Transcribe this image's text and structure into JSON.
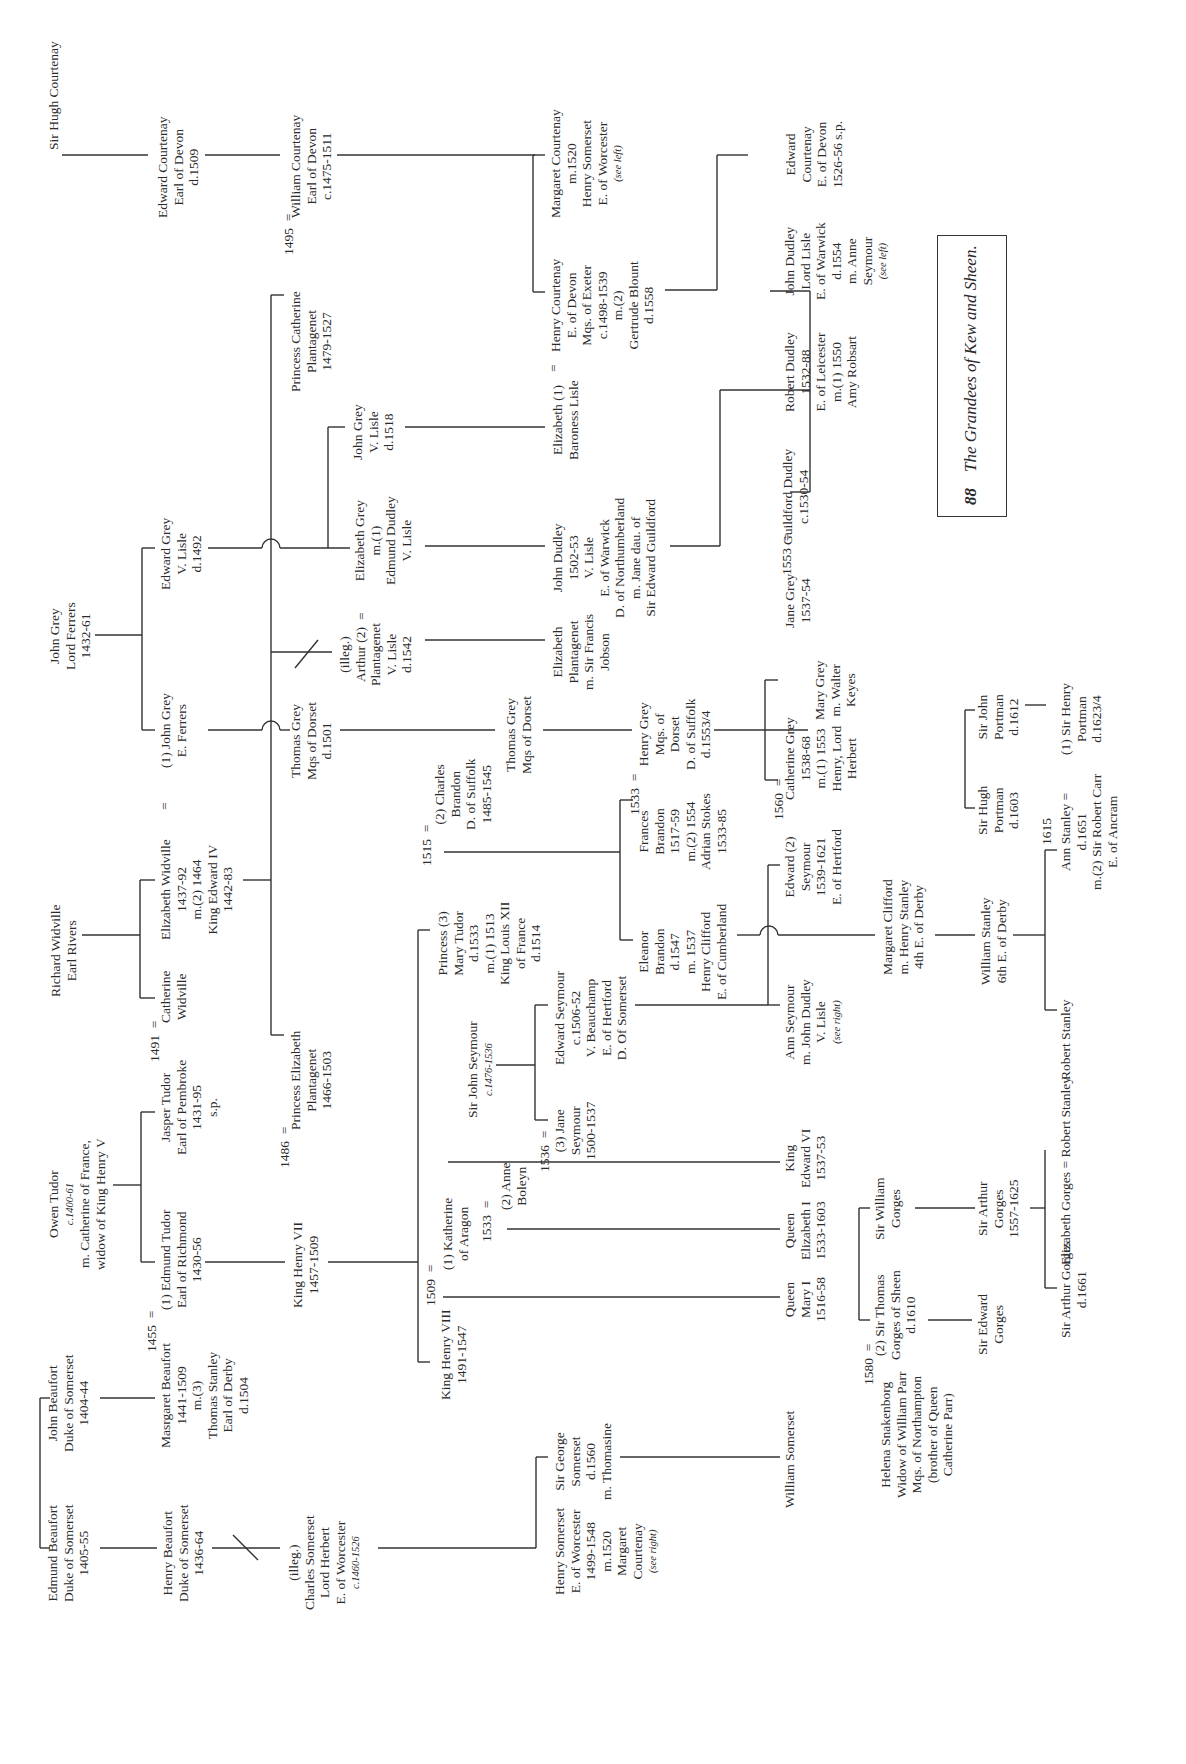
{
  "title": {
    "page_number": "88",
    "text": "The Grandees of Kew and Sheen."
  },
  "people": {
    "hugh_courtenay": [
      "Sir Hugh Courtenay"
    ],
    "edward_courtenay_d1509": [
      "Edward Courtenay",
      "Earl of Devon",
      "d.1509"
    ],
    "william_courtenay": [
      "William Courtenay",
      "Earl of Devon",
      "c.1475-1511"
    ],
    "margaret_courtenay": [
      "Margaret Courtenay",
      "m.1520",
      "Henry Somerset",
      "E. of Worcester",
      "(see left)"
    ],
    "henry_courtenay": [
      "Henry Courtenay",
      "E. of Devon",
      "Mqs. of Exeter",
      "c.1498-1539",
      "m.(2)",
      "Gertrude Blount",
      "d.1558"
    ],
    "edward_courtenay_1526": [
      "Edward",
      "Courtenay",
      "E. of Devon",
      "1526-56 s.p."
    ],
    "catherine_plantagenet": [
      "Princess Catherine",
      "Plantagenet",
      "1479-1527"
    ],
    "john_grey_ferrers": [
      "John Grey",
      "Lord Ferrers",
      "1432-61"
    ],
    "edward_grey": [
      "Edward Grey",
      "V. Lisle",
      "d.1492"
    ],
    "john_grey_e_ferrers": [
      "(1) John Grey",
      "E. Ferrers"
    ],
    "john_grey_lisle": [
      "John Grey",
      "V. Lisle",
      "d.1518"
    ],
    "elizabeth_grey": [
      "Elizabeth Grey",
      "m.(1)",
      "Edmund Dudley",
      "V. Lisle"
    ],
    "elizabeth_baroness_lisle": [
      "Elizabeth (1)",
      "Baroness Lisle"
    ],
    "john_dudley_northumberland": [
      "John Dudley",
      "1502-53",
      "V. Lisle",
      "E. of Warwick",
      "D. of Northumberland",
      "m. Jane dau. of",
      "Sir Edward Guildford"
    ],
    "guildford_dudley": [
      "Guildford Dudley",
      "c.1530-54"
    ],
    "robert_dudley": [
      "Robert Dudley",
      "1532-88",
      "E. of Leicester",
      "m.(1) 1550",
      "Amy Robsart"
    ],
    "john_dudley_warwick": [
      "John Dudley",
      "Lord Lisle",
      "E. of Warwick",
      "d.1554",
      "m. Anne",
      "Seymour",
      "(see left)"
    ],
    "thomas_grey_d1501": [
      "Thomas Grey",
      "Mqs of Dorset",
      "d.1501"
    ],
    "arthur_plantagenet": [
      "(illeg.)",
      "Arthur (2)",
      "Plantagenet",
      "V. Lisle",
      "d.1542"
    ],
    "elizabeth_plantagenet_jobson": [
      "Elizabeth",
      "Plantagenet",
      "m. Sir Francis",
      "Jobson"
    ],
    "thomas_grey_2": [
      "Thomas Grey",
      "Mqs of Dorset"
    ],
    "henry_grey": [
      "Henry Grey",
      "Mqs. of",
      "Dorset",
      "D. of Suffolk",
      "d.1553/4"
    ],
    "jane_grey": [
      "Jane Grey",
      "1537-54"
    ],
    "mary_grey": [
      "Mary Grey",
      "m. Walter",
      "Keyes"
    ],
    "catherine_grey": [
      "Catherine Grey",
      "1538-68",
      "m.(1) 1553",
      "Henry, Lord",
      "Herbert"
    ],
    "richard_widville": [
      "Richard Widville",
      "Earl Rivers"
    ],
    "elizabeth_widville": [
      "Elizabeth Widville",
      "1437-92",
      "m.(2) 1464",
      "King Edward IV",
      "1442-83"
    ],
    "catherine_widville": [
      "Catherine",
      "Widville"
    ],
    "charles_brandon": [
      "(2) Charles",
      "Brandon",
      "D. of Suffolk",
      "1485-1545"
    ],
    "mary_tudor": [
      "Princess (3)",
      "Mary Tudor",
      "d.1533",
      "m.(1) 1513",
      "King Louis XII",
      "of France",
      "d.1514"
    ],
    "frances_brandon": [
      "Frances",
      "Brandon",
      "1517-59",
      "m.(2) 1554",
      "Adrian Stokes",
      "1533-85"
    ],
    "eleanor_brandon": [
      "Eleanor",
      "Brandon",
      "d.1547",
      "m. 1537",
      "Henry Clifford",
      "E. of Cumberland"
    ],
    "edward_seymour_hertford": [
      "Edward (2)",
      "Seymour",
      "1539-1621",
      "E. of Hertford"
    ],
    "owen_tudor": [
      "Owen Tudor",
      "c.1400-61",
      "m. Catherine of France,",
      "widow of King Henry V"
    ],
    "jasper_tudor": [
      "Jasper Tudor",
      "Earl of Pembroke",
      "1431-95",
      "s.p."
    ],
    "edmund_tudor": [
      "(1) Edmund Tudor",
      "Earl of Richmond",
      "1430-56"
    ],
    "elizabeth_plantagenet": [
      "Princess Elizabeth",
      "Plantagenet",
      "1466-1503"
    ],
    "henry_vii": [
      "King Henry VII",
      "1457-1509"
    ],
    "john_seymour": [
      "Sir John Seymour",
      "c.1476-1536"
    ],
    "edward_seymour_somerset": [
      "Edward Seymour",
      "c.1506-52",
      "V. Beauchamp",
      "E. of Hertford",
      "D. Of Somerset"
    ],
    "jane_seymour": [
      "(3) Jane",
      "Seymour",
      "1500-1537"
    ],
    "anne_boleyn": [
      "(2) Anne",
      "Boleyn"
    ],
    "katherine_aragon": [
      "(1) Katherine",
      "of Aragon"
    ],
    "henry_viii": [
      "King Henry VIII",
      "1491-1547"
    ],
    "ann_seymour": [
      "Ann Seymour",
      "m. John Dudley",
      "V. Lisle",
      "(see right)"
    ],
    "margaret_clifford": [
      "Margaret Clifford",
      "m. Henry Stanley",
      "4th E. of Derby"
    ],
    "william_stanley": [
      "William Stanley",
      "6th E. of Derby"
    ],
    "ann_stanley": [
      "Ann Stanley =",
      "d.1651",
      "m.(2) Sir Robert Carr",
      "E. of Ancram"
    ],
    "robert_stanley": [
      "Robert Stanley"
    ],
    "hugh_portman": [
      "Sir Hugh",
      "Portman",
      "d.1603"
    ],
    "john_portman": [
      "Sir John",
      "Portman",
      "d.1612"
    ],
    "henry_portman": [
      "(1) Sir Henry",
      "Portman",
      "d.1623/4"
    ],
    "edward_vi": [
      "King",
      "Edward VI",
      "1537-53"
    ],
    "elizabeth_i": [
      "Queen",
      "Elizabeth I",
      "1533-1603"
    ],
    "mary_i": [
      "Queen",
      "Mary I",
      "1516-58"
    ],
    "william_somerset": [
      "William Somerset"
    ],
    "edmund_beaufort": [
      "Edmund Beaufort",
      "Duke of Somerset",
      "1405-55"
    ],
    "john_beaufort": [
      "John Beaufort",
      "Duke of Somerset",
      "1404-44"
    ],
    "margaret_beaufort": [
      "Masrgaret Beaufort",
      "1441-1509",
      "m.(3)",
      "Thomas Stanley",
      "Earl of Derby",
      "d.1504"
    ],
    "henry_beaufort": [
      "Henry Beaufort",
      "Duke of Somerset",
      "1436-64"
    ],
    "charles_somerset": [
      "(illeg.)",
      "Charles Somerset",
      "Lord Herbert",
      "E. of Worcester",
      "c.1460-1526"
    ],
    "henry_somerset": [
      "Henry Somerset",
      "E. of Worcester",
      "1499-1548",
      "m.1520",
      "Margaret",
      "Courtenay",
      "(see right)"
    ],
    "george_somerset": [
      "Sir George",
      "Somerset",
      "d.1560",
      "m. Thomasine"
    ],
    "helena_snakenborg": [
      "Helena Snakenborg",
      "Widow of William Parr",
      "Mqs. of Northampton",
      "(brother of Queen",
      "Catherine Parr)"
    ],
    "thomas_gorges": [
      "(2) Sir Thomas",
      "Gorges of Sheen",
      "d.1610"
    ],
    "william_gorges": [
      "Sir William",
      "Gorges"
    ],
    "edward_gorges": [
      "Sir Edward",
      "Gorges"
    ],
    "arthur_gorges_1557": [
      "Sir Arthur",
      "Gorges",
      "1557-1625"
    ],
    "arthur_gorges_1661": [
      "Sir Arthur Gorges",
      "d.1661"
    ],
    "elizabeth_gorges": [
      "Elizabeth Gorges = Robert Stanley"
    ]
  },
  "marriages": [
    {
      "id": "m1495",
      "year": "1495",
      "sign": "="
    },
    {
      "id": "m1491",
      "year": "1491",
      "sign": "="
    },
    {
      "id": "m1486",
      "year": "1486",
      "sign": "="
    },
    {
      "id": "m1455",
      "year": "1455",
      "sign": "="
    },
    {
      "id": "m1509",
      "year": "1509",
      "sign": "="
    },
    {
      "id": "m1533a",
      "year": "1533",
      "sign": "="
    },
    {
      "id": "m1536",
      "year": "1536",
      "sign": "="
    },
    {
      "id": "m1515",
      "year": "1515",
      "sign": "="
    },
    {
      "id": "m1533b",
      "year": "1533",
      "sign": "="
    },
    {
      "id": "m1553",
      "year": "1553",
      "sign": "="
    },
    {
      "id": "m1560",
      "year": "1560",
      "sign": "="
    },
    {
      "id": "m1580",
      "year": "1580",
      "sign": "="
    },
    {
      "id": "m1615",
      "year": "1615",
      "sign": ""
    },
    {
      "id": "m_widville",
      "year": "",
      "sign": "="
    },
    {
      "id": "m_arthur",
      "year": "",
      "sign": "="
    },
    {
      "id": "m_elizabeth_lisle",
      "year": "",
      "sign": "="
    }
  ]
}
